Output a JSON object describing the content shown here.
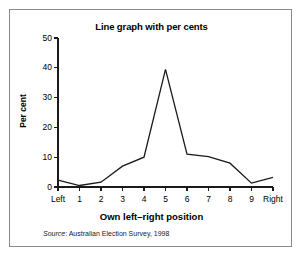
{
  "figure": {
    "title": "Line graph with per cents",
    "source_prefix": "Source",
    "source_text": ": Australian Election Survey, 1998",
    "frame_color": "#8a8a8a",
    "line_color": "#1a1a1a",
    "text_color": "#000000"
  },
  "chart_data": {
    "type": "line",
    "title": "Line graph with per cents",
    "xlabel": "Own left–right position",
    "ylabel": "Per cent",
    "categories": [
      "Left",
      "1",
      "2",
      "3",
      "4",
      "5",
      "6",
      "7",
      "8",
      "9",
      "Right"
    ],
    "values": [
      2.3,
      0.5,
      1.6,
      7.0,
      10.0,
      39.5,
      11.0,
      10.2,
      8.0,
      1.3,
      3.2
    ],
    "xticklabels": [
      "Left",
      "1",
      "2",
      "3",
      "4",
      "5",
      "6",
      "7",
      "8",
      "9",
      "Right"
    ],
    "yticklabels": [
      "0",
      "10",
      "20",
      "30",
      "40",
      "50"
    ],
    "yticks": [
      0,
      10,
      20,
      30,
      40,
      50
    ],
    "ylim": [
      0,
      50
    ],
    "xlim": [
      0,
      10
    ],
    "grid": false,
    "legend": false,
    "annotation": "Source: Australian Election Survey, 1998"
  }
}
